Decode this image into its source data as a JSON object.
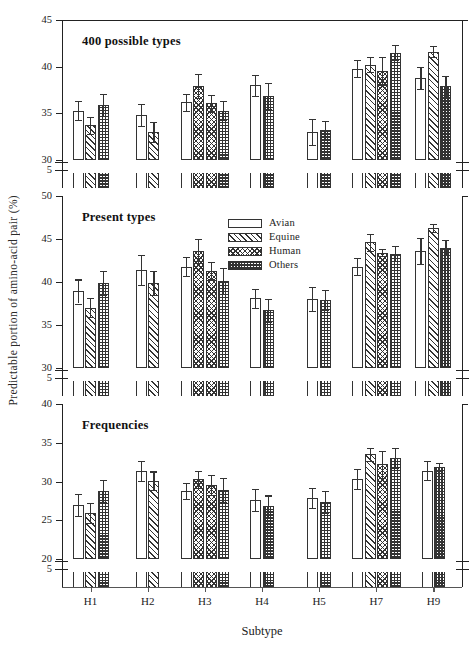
{
  "figure": {
    "ylabel": "Predictable portion of amino-acid pair (%)",
    "xlabel": "Subtype",
    "legend_title": "",
    "caption": ""
  },
  "legend": [
    {
      "label": "Avian",
      "fill": "avian"
    },
    {
      "label": "Equine",
      "fill": "equine"
    },
    {
      "label": "Human",
      "fill": "human"
    },
    {
      "label": "Others",
      "fill": "others"
    }
  ],
  "chart_data": {
    "type": "bar",
    "title": "",
    "xlabel": "Subtype",
    "ylabel": "Predictable portion of amino-acid pair (%)",
    "grid": false,
    "legend_position": "inside-upper-right-middle-panel",
    "categories": [
      "H1",
      "H2",
      "H3",
      "H4",
      "H5",
      "H7",
      "H9"
    ],
    "series_names": [
      "Avian",
      "Equine",
      "Human",
      "Others"
    ],
    "panels": [
      {
        "name": "400 possible types",
        "ylim": [
          30,
          45
        ],
        "yticks": [
          30,
          35,
          40,
          45
        ],
        "axis_break_tick": 5,
        "groups": [
          {
            "category": "H1",
            "bars": [
              {
                "series": "Avian",
                "value": 35.3,
                "err": 1.0
              },
              {
                "series": "Equine",
                "value": 33.7,
                "err": 0.9
              },
              {
                "series": "Others",
                "value": 35.9,
                "err": 1.2
              }
            ]
          },
          {
            "category": "H2",
            "bars": [
              {
                "series": "Avian",
                "value": 34.8,
                "err": 1.2
              },
              {
                "series": "Equine",
                "value": 33.0,
                "err": 1.1
              }
            ]
          },
          {
            "category": "H3",
            "bars": [
              {
                "series": "Avian",
                "value": 36.2,
                "err": 0.9
              },
              {
                "series": "Human",
                "value": 37.9,
                "err": 1.3
              },
              {
                "series": "Human",
                "value": 36.1,
                "err": 0.9
              },
              {
                "series": "Others",
                "value": 35.3,
                "err": 1.0
              }
            ]
          },
          {
            "category": "H4",
            "bars": [
              {
                "series": "Avian",
                "value": 38.0,
                "err": 1.1
              },
              {
                "series": "Others",
                "value": 36.9,
                "err": 1.4
              }
            ]
          },
          {
            "category": "H5",
            "bars": [
              {
                "series": "Avian",
                "value": 33.0,
                "err": 1.4
              },
              {
                "series": "Others",
                "value": 33.2,
                "err": 1.0
              }
            ]
          },
          {
            "category": "H7",
            "bars": [
              {
                "series": "Avian",
                "value": 39.8,
                "err": 0.9
              },
              {
                "series": "Equine",
                "value": 40.2,
                "err": 0.8
              },
              {
                "series": "Human",
                "value": 39.5,
                "err": 1.5
              },
              {
                "series": "Others",
                "value": 41.5,
                "err": 0.8
              }
            ]
          },
          {
            "category": "H9",
            "bars": [
              {
                "series": "Avian",
                "value": 38.8,
                "err": 1.2
              },
              {
                "series": "Equine",
                "value": 41.6,
                "err": 0.6
              },
              {
                "series": "Others",
                "value": 37.9,
                "err": 1.1
              }
            ]
          }
        ]
      },
      {
        "name": "Present types",
        "ylim": [
          30,
          50
        ],
        "yticks": [
          30,
          35,
          40,
          45,
          50
        ],
        "axis_break_tick": 5,
        "groups": [
          {
            "category": "H1",
            "bars": [
              {
                "series": "Avian",
                "value": 38.9,
                "err": 1.4
              },
              {
                "series": "Equine",
                "value": 37.0,
                "err": 1.1
              },
              {
                "series": "Others",
                "value": 39.9,
                "err": 1.4
              }
            ]
          },
          {
            "category": "H2",
            "bars": [
              {
                "series": "Avian",
                "value": 41.4,
                "err": 1.7
              },
              {
                "series": "Equine",
                "value": 39.9,
                "err": 1.4
              }
            ]
          },
          {
            "category": "H3",
            "bars": [
              {
                "series": "Avian",
                "value": 41.8,
                "err": 1.1
              },
              {
                "series": "Human",
                "value": 43.6,
                "err": 1.4
              },
              {
                "series": "Human",
                "value": 41.3,
                "err": 1.0
              },
              {
                "series": "Others",
                "value": 40.1,
                "err": 1.5
              }
            ]
          },
          {
            "category": "H4",
            "bars": [
              {
                "series": "Avian",
                "value": 38.1,
                "err": 1.1
              },
              {
                "series": "Others",
                "value": 36.7,
                "err": 1.3
              }
            ]
          },
          {
            "category": "H5",
            "bars": [
              {
                "series": "Avian",
                "value": 38.0,
                "err": 1.4
              },
              {
                "series": "Others",
                "value": 37.9,
                "err": 1.2
              }
            ]
          },
          {
            "category": "H7",
            "bars": [
              {
                "series": "Avian",
                "value": 41.8,
                "err": 1.0
              },
              {
                "series": "Equine",
                "value": 44.6,
                "err": 1.0
              },
              {
                "series": "Human",
                "value": 43.4,
                "err": 0.4
              },
              {
                "series": "Others",
                "value": 43.3,
                "err": 0.9
              }
            ]
          },
          {
            "category": "H9",
            "bars": [
              {
                "series": "Avian",
                "value": 43.6,
                "err": 1.5
              },
              {
                "series": "Equine",
                "value": 46.3,
                "err": 0.5
              },
              {
                "series": "Others",
                "value": 44.0,
                "err": 0.9
              }
            ]
          }
        ]
      },
      {
        "name": "Frequencies",
        "ylim": [
          20,
          40
        ],
        "yticks": [
          20,
          25,
          30,
          35,
          40
        ],
        "axis_break_tick": 5,
        "groups": [
          {
            "category": "H1",
            "bars": [
              {
                "series": "Avian",
                "value": 27.0,
                "err": 1.4
              },
              {
                "series": "Equine",
                "value": 25.9,
                "err": 1.3
              },
              {
                "series": "Others",
                "value": 28.8,
                "err": 1.4
              }
            ]
          },
          {
            "category": "H2",
            "bars": [
              {
                "series": "Avian",
                "value": 31.4,
                "err": 1.3
              },
              {
                "series": "Equine",
                "value": 30.1,
                "err": 1.2
              }
            ]
          },
          {
            "category": "H3",
            "bars": [
              {
                "series": "Avian",
                "value": 28.8,
                "err": 1.0
              },
              {
                "series": "Human",
                "value": 30.3,
                "err": 1.1
              },
              {
                "series": "Human",
                "value": 29.6,
                "err": 1.3
              },
              {
                "series": "Others",
                "value": 28.9,
                "err": 1.5
              }
            ]
          },
          {
            "category": "H4",
            "bars": [
              {
                "series": "Avian",
                "value": 27.6,
                "err": 1.4
              },
              {
                "series": "Others",
                "value": 26.8,
                "err": 1.4
              }
            ]
          },
          {
            "category": "H5",
            "bars": [
              {
                "series": "Avian",
                "value": 27.9,
                "err": 1.3
              },
              {
                "series": "Others",
                "value": 27.4,
                "err": 1.4
              }
            ]
          },
          {
            "category": "H7",
            "bars": [
              {
                "series": "Avian",
                "value": 30.3,
                "err": 1.3
              },
              {
                "series": "Equine",
                "value": 33.5,
                "err": 0.8
              },
              {
                "series": "Human",
                "value": 32.2,
                "err": 1.7
              },
              {
                "series": "Others",
                "value": 33.0,
                "err": 1.3
              }
            ]
          },
          {
            "category": "H9",
            "bars": [
              {
                "series": "Avian",
                "value": 31.4,
                "err": 1.2
              },
              {
                "series": "Others",
                "value": 31.9,
                "err": 0.5
              }
            ]
          }
        ]
      }
    ]
  }
}
